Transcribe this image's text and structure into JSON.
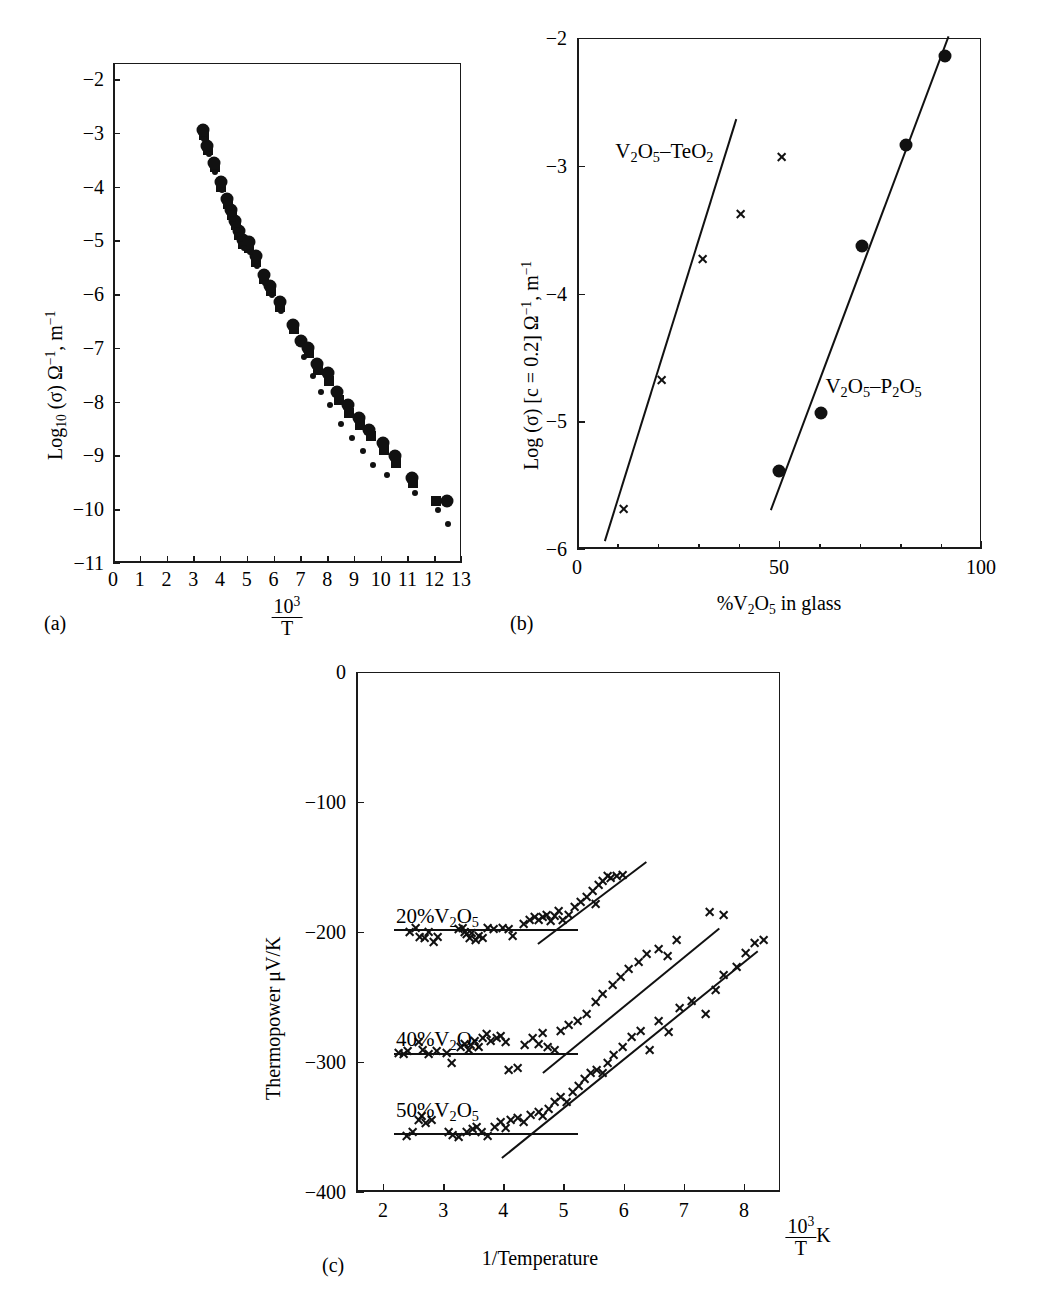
{
  "figure": {
    "panel_a_tag": "(a)",
    "panel_b_tag": "(b)",
    "panel_c_tag": "(c)"
  },
  "chart_data": [
    {
      "id": "panel-a",
      "type": "scatter",
      "title": "",
      "xlabel_numerator": "10",
      "xlabel_exponent": "3",
      "xlabel_denominator": "T",
      "ylabel": "Log10 (σ) Ω−1, m−1",
      "xlim": [
        0,
        13
      ],
      "ylim": [
        -11,
        -1.7
      ],
      "grid": false,
      "legend": "none",
      "xticks": [
        "0",
        "1",
        "2",
        "3",
        "4",
        "5",
        "6",
        "7",
        "8",
        "9",
        "10",
        "11",
        "12",
        "13"
      ],
      "yticks": [
        "-2",
        "-3",
        "-4",
        "-5",
        "-6",
        "-7",
        "-8",
        "-9",
        "-10",
        "-11"
      ],
      "series": [
        {
          "name": "large-circle",
          "marker": "circle",
          "points": [
            [
              3.3,
              -2.93
            ],
            [
              3.45,
              -3.22
            ],
            [
              3.7,
              -3.55
            ],
            [
              3.95,
              -3.9
            ],
            [
              4.2,
              -4.22
            ],
            [
              4.35,
              -4.42
            ],
            [
              4.5,
              -4.62
            ],
            [
              4.62,
              -4.8
            ],
            [
              4.78,
              -4.97
            ],
            [
              5.0,
              -5.02
            ],
            [
              5.25,
              -5.28
            ],
            [
              5.55,
              -5.62
            ],
            [
              5.8,
              -5.83
            ],
            [
              6.15,
              -6.12
            ],
            [
              6.65,
              -6.55
            ],
            [
              6.95,
              -6.86
            ],
            [
              7.2,
              -6.98
            ],
            [
              7.55,
              -7.28
            ],
            [
              7.95,
              -7.45
            ],
            [
              8.3,
              -7.8
            ],
            [
              8.7,
              -8.05
            ],
            [
              9.1,
              -8.28
            ],
            [
              9.5,
              -8.5
            ],
            [
              10.0,
              -8.75
            ],
            [
              10.45,
              -9.0
            ],
            [
              11.1,
              -9.4
            ],
            [
              12.4,
              -9.82
            ]
          ]
        },
        {
          "name": "square",
          "marker": "square",
          "points": [
            [
              3.32,
              -3.02
            ],
            [
              3.48,
              -3.3
            ],
            [
              3.72,
              -3.62
            ],
            [
              3.97,
              -3.98
            ],
            [
              4.22,
              -4.3
            ],
            [
              4.37,
              -4.5
            ],
            [
              4.52,
              -4.7
            ],
            [
              4.64,
              -4.88
            ],
            [
              4.8,
              -5.05
            ],
            [
              5.02,
              -5.12
            ],
            [
              5.28,
              -5.38
            ],
            [
              5.58,
              -5.7
            ],
            [
              5.83,
              -5.92
            ],
            [
              6.18,
              -6.22
            ],
            [
              6.68,
              -6.62
            ],
            [
              7.25,
              -7.08
            ],
            [
              7.6,
              -7.4
            ],
            [
              8.0,
              -7.6
            ],
            [
              8.35,
              -7.95
            ],
            [
              8.75,
              -8.2
            ],
            [
              9.15,
              -8.42
            ],
            [
              9.55,
              -8.62
            ],
            [
              10.05,
              -8.88
            ],
            [
              10.5,
              -9.12
            ],
            [
              11.15,
              -9.5
            ],
            [
              12.0,
              -9.82
            ]
          ]
        },
        {
          "name": "small-dot",
          "marker": "dot",
          "points": [
            [
              3.34,
              -3.1
            ],
            [
              3.5,
              -3.38
            ],
            [
              3.74,
              -3.7
            ],
            [
              3.99,
              -4.05
            ],
            [
              4.24,
              -4.38
            ],
            [
              4.39,
              -4.58
            ],
            [
              4.54,
              -4.78
            ],
            [
              4.66,
              -4.95
            ],
            [
              4.82,
              -5.12
            ],
            [
              5.05,
              -5.2
            ],
            [
              5.3,
              -5.46
            ],
            [
              5.6,
              -5.78
            ],
            [
              5.86,
              -6.0
            ],
            [
              6.2,
              -6.3
            ],
            [
              7.05,
              -7.15
            ],
            [
              7.4,
              -7.5
            ],
            [
              7.7,
              -7.8
            ],
            [
              8.05,
              -8.05
            ],
            [
              8.45,
              -8.4
            ],
            [
              8.85,
              -8.65
            ],
            [
              9.25,
              -8.9
            ],
            [
              9.65,
              -9.15
            ],
            [
              10.15,
              -9.35
            ],
            [
              11.2,
              -9.68
            ],
            [
              12.05,
              -10.0
            ],
            [
              12.45,
              -10.25
            ]
          ]
        }
      ]
    },
    {
      "id": "panel-b",
      "type": "scatter",
      "title": "",
      "xlabel": "%V2O5 in glass",
      "ylabel": "Log (σ) [c = 0.2] Ω−1, m−1",
      "xlim": [
        0,
        100
      ],
      "ylim": [
        -6,
        -2
      ],
      "grid": false,
      "legend": "inline-annotations",
      "xticks": [
        "0",
        "50",
        "100"
      ],
      "yticks": [
        "-2",
        "-3",
        "-4",
        "-5",
        "-6"
      ],
      "annotations": [
        {
          "text": "V2O5-TeO2",
          "x": 9,
          "y": -2.78
        },
        {
          "text": "V2O5-P2O5",
          "x": 61,
          "y": -4.62
        }
      ],
      "series": [
        {
          "name": "V2O5-TeO2",
          "marker": "cross",
          "points": [
            [
              11.0,
              -5.68
            ],
            [
              20.5,
              -4.67
            ],
            [
              30.5,
              -3.72
            ],
            [
              40.0,
              -3.37
            ],
            [
              50.0,
              -2.92
            ]
          ],
          "fit": {
            "x0": 6.5,
            "y0": -5.92,
            "x1": 39.0,
            "y1": -2.62
          }
        },
        {
          "name": "V2O5-P2O5",
          "marker": "circle",
          "points": [
            [
              49.5,
              -5.38
            ],
            [
              60.0,
              -4.93
            ],
            [
              70.0,
              -3.62
            ],
            [
              81.0,
              -2.83
            ],
            [
              90.5,
              -2.13
            ]
          ],
          "fit": {
            "x0": 47.5,
            "y0": -5.68,
            "x1": 91.5,
            "y1": -1.97
          }
        }
      ]
    },
    {
      "id": "panel-c",
      "type": "scatter",
      "title": "",
      "xlabel": "1/Temperature",
      "xlabel_right_numerator": "10",
      "xlabel_right_exponent": "3",
      "xlabel_right_denominator": "T",
      "xlabel_right_unit": "K",
      "ylabel": "Thermopower μV/K",
      "xlim": [
        1.55,
        8.6
      ],
      "ylim": [
        -400,
        0
      ],
      "grid": false,
      "legend": "inline-annotations",
      "xticks": [
        "2",
        "3",
        "4",
        "5",
        "6",
        "7",
        "8"
      ],
      "yticks": [
        "0",
        "-100",
        "-200",
        "-300",
        "-400"
      ],
      "annotations": [
        {
          "text": "20%V2O5",
          "x": 2.18,
          "y": -178
        },
        {
          "text": "40%V2O5",
          "x": 2.18,
          "y": -272
        },
        {
          "text": "50%V2O5",
          "x": 2.18,
          "y": -327
        }
      ],
      "series": [
        {
          "name": "20%V2O5",
          "marker": "cross",
          "plateau": {
            "x0": 2.15,
            "x1": 5.2,
            "y": -197
          },
          "slope_fit": {
            "x0": 4.55,
            "y0": -208,
            "x1": 6.35,
            "y1": -145
          },
          "points": [
            [
              2.4,
              -199
            ],
            [
              2.5,
              -196
            ],
            [
              2.58,
              -203
            ],
            [
              2.65,
              -204
            ],
            [
              2.72,
              -199
            ],
            [
              2.8,
              -207
            ],
            [
              2.88,
              -203
            ],
            [
              3.22,
              -197
            ],
            [
              3.28,
              -196
            ],
            [
              3.32,
              -199
            ],
            [
              3.36,
              -201
            ],
            [
              3.4,
              -204
            ],
            [
              3.44,
              -200
            ],
            [
              3.5,
              -205
            ],
            [
              3.55,
              -202
            ],
            [
              3.62,
              -204
            ],
            [
              3.7,
              -196
            ],
            [
              3.8,
              -197
            ],
            [
              3.95,
              -196
            ],
            [
              4.05,
              -197
            ],
            [
              4.12,
              -202
            ],
            [
              4.3,
              -193
            ],
            [
              4.4,
              -190
            ],
            [
              4.48,
              -188
            ],
            [
              4.55,
              -190
            ],
            [
              4.62,
              -188
            ],
            [
              4.68,
              -186
            ],
            [
              4.75,
              -191
            ],
            [
              4.82,
              -187
            ],
            [
              4.88,
              -183
            ],
            [
              4.95,
              -190
            ],
            [
              5.05,
              -186
            ],
            [
              5.15,
              -180
            ],
            [
              5.25,
              -176
            ],
            [
              5.35,
              -172
            ],
            [
              5.45,
              -168
            ],
            [
              5.55,
              -163
            ],
            [
              5.62,
              -160
            ],
            [
              5.75,
              -158
            ],
            [
              5.85,
              -156
            ],
            [
              5.95,
              -155
            ],
            [
              5.5,
              -178
            ],
            [
              5.7,
              -156
            ]
          ]
        },
        {
          "name": "40%V2O5",
          "marker": "cross",
          "plateau": {
            "x0": 2.15,
            "x1": 5.2,
            "y": -292
          },
          "slope_fit": {
            "x0": 4.62,
            "y0": -307,
            "x1": 7.55,
            "y1": -196
          },
          "points": [
            [
              2.22,
              -292
            ],
            [
              2.3,
              -293
            ],
            [
              2.38,
              -291
            ],
            [
              2.55,
              -284
            ],
            [
              2.62,
              -290
            ],
            [
              2.72,
              -293
            ],
            [
              2.85,
              -291
            ],
            [
              3.02,
              -292
            ],
            [
              3.1,
              -300
            ],
            [
              3.25,
              -288
            ],
            [
              3.32,
              -285
            ],
            [
              3.38,
              -290
            ],
            [
              3.42,
              -286
            ],
            [
              3.48,
              -283
            ],
            [
              3.55,
              -288
            ],
            [
              3.62,
              -281
            ],
            [
              3.68,
              -278
            ],
            [
              3.75,
              -283
            ],
            [
              3.85,
              -281
            ],
            [
              3.92,
              -279
            ],
            [
              4.0,
              -284
            ],
            [
              4.05,
              -305
            ],
            [
              4.2,
              -304
            ],
            [
              4.32,
              -286
            ],
            [
              4.45,
              -281
            ],
            [
              4.55,
              -285
            ],
            [
              4.62,
              -277
            ],
            [
              4.7,
              -288
            ],
            [
              4.82,
              -290
            ],
            [
              4.92,
              -275
            ],
            [
              5.05,
              -271
            ],
            [
              5.2,
              -268
            ],
            [
              5.35,
              -262
            ],
            [
              5.5,
              -253
            ],
            [
              5.62,
              -247
            ],
            [
              5.78,
              -240
            ],
            [
              5.92,
              -234
            ],
            [
              6.05,
              -228
            ],
            [
              6.22,
              -222
            ],
            [
              6.35,
              -216
            ],
            [
              6.55,
              -212
            ],
            [
              6.7,
              -218
            ],
            [
              6.85,
              -205
            ],
            [
              7.4,
              -184
            ],
            [
              7.62,
              -186
            ]
          ]
        },
        {
          "name": "50%V2O5",
          "marker": "cross",
          "plateau": {
            "x0": 2.15,
            "x1": 5.2,
            "y": -354
          },
          "slope_fit": {
            "x0": 3.95,
            "y0": -372,
            "x1": 8.2,
            "y1": -213
          },
          "points": [
            [
              2.35,
              -356
            ],
            [
              2.45,
              -353
            ],
            [
              2.55,
              -344
            ],
            [
              2.6,
              -341
            ],
            [
              2.68,
              -346
            ],
            [
              2.78,
              -344
            ],
            [
              3.05,
              -353
            ],
            [
              3.12,
              -355
            ],
            [
              3.22,
              -357
            ],
            [
              3.35,
              -353
            ],
            [
              3.45,
              -351
            ],
            [
              3.52,
              -349
            ],
            [
              3.6,
              -353
            ],
            [
              3.7,
              -356
            ],
            [
              3.82,
              -349
            ],
            [
              3.92,
              -345
            ],
            [
              4.0,
              -350
            ],
            [
              4.08,
              -344
            ],
            [
              4.2,
              -342
            ],
            [
              4.3,
              -345
            ],
            [
              4.42,
              -340
            ],
            [
              4.55,
              -338
            ],
            [
              4.62,
              -341
            ],
            [
              4.72,
              -335
            ],
            [
              4.82,
              -330
            ],
            [
              4.92,
              -326
            ],
            [
              5.02,
              -330
            ],
            [
              5.12,
              -322
            ],
            [
              5.22,
              -318
            ],
            [
              5.32,
              -312
            ],
            [
              5.42,
              -308
            ],
            [
              5.52,
              -305
            ],
            [
              5.62,
              -308
            ],
            [
              5.7,
              -300
            ],
            [
              5.8,
              -294
            ],
            [
              5.95,
              -288
            ],
            [
              6.1,
              -280
            ],
            [
              6.25,
              -275
            ],
            [
              6.4,
              -290
            ],
            [
              6.55,
              -268
            ],
            [
              6.72,
              -276
            ],
            [
              6.9,
              -258
            ],
            [
              7.1,
              -252
            ],
            [
              7.32,
              -262
            ],
            [
              7.5,
              -244
            ],
            [
              7.62,
              -232
            ],
            [
              7.85,
              -226
            ],
            [
              8.0,
              -215
            ],
            [
              8.15,
              -208
            ],
            [
              8.3,
              -205
            ]
          ]
        }
      ]
    }
  ]
}
